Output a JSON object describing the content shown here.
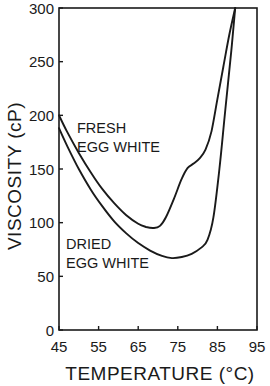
{
  "chart_data": {
    "type": "line",
    "title": "",
    "xlabel": "TEMPERATURE (°C)",
    "ylabel": "VISCOSITY (cP)",
    "xlim": [
      45,
      95
    ],
    "ylim": [
      0,
      300
    ],
    "xticks": [
      45,
      55,
      65,
      75,
      85,
      95
    ],
    "yticks": [
      0,
      50,
      100,
      150,
      200,
      250,
      300
    ],
    "xtick_labels": [
      "45",
      "55",
      "65",
      "75",
      "85",
      "95"
    ],
    "ytick_labels": [
      "0",
      "50",
      "100",
      "150",
      "200",
      "250",
      "300"
    ],
    "grid": false,
    "legend": "none (inline annotations)",
    "series": [
      {
        "name": "FRESH EGG WHITE",
        "label_lines": [
          "FRESH",
          "EGG WHITE"
        ],
        "x": [
          45,
          47,
          50,
          53,
          56,
          59,
          62,
          65,
          67,
          69,
          70.5,
          72,
          74,
          76,
          77.5,
          79,
          80.5,
          82,
          83.5,
          85,
          86.5,
          88,
          89.5
        ],
        "y": [
          200,
          185,
          165,
          147,
          131,
          118,
          107,
          99,
          96,
          95,
          97,
          105,
          122,
          141,
          151,
          155,
          160,
          168,
          185,
          215,
          245,
          275,
          300
        ]
      },
      {
        "name": "DRIED EGG WHITE",
        "label_lines": [
          "DRIED",
          "EGG WHITE"
        ],
        "x": [
          45,
          47,
          50,
          53,
          56,
          59,
          62,
          65,
          68,
          71,
          73.5,
          76,
          78.5,
          81,
          82.5,
          84,
          85.5,
          87,
          88.5,
          89.5
        ],
        "y": [
          188,
          172,
          150,
          131,
          115,
          101,
          90,
          81,
          74,
          69,
          67,
          68,
          71,
          77,
          84,
          105,
          150,
          205,
          260,
          300
        ]
      }
    ]
  }
}
